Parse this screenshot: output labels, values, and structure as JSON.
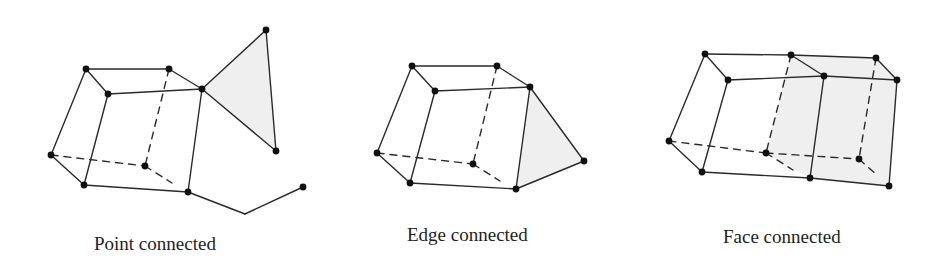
{
  "figure": {
    "background": "#ffffff",
    "line_color": "#2a2a2a",
    "fill_color": "#efefef",
    "dot_color": "#111111",
    "panels": [
      {
        "id": "point-connected",
        "caption": "Point connected",
        "caption_pos": [
          94,
          250
        ],
        "shaded": [
          [
            [
              202,
              89
            ],
            [
              266,
              30
            ],
            [
              276,
              151
            ]
          ]
        ],
        "solid_edges": [
          [
            [
              86,
              69
            ],
            [
              169,
              69
            ]
          ],
          [
            [
              86,
              69
            ],
            [
              108,
              94
            ]
          ],
          [
            [
              169,
              69
            ],
            [
              202,
              89
            ]
          ],
          [
            [
              108,
              94
            ],
            [
              202,
              89
            ]
          ],
          [
            [
              86,
              69
            ],
            [
              51,
              155
            ]
          ],
          [
            [
              108,
              94
            ],
            [
              84,
              185
            ]
          ],
          [
            [
              202,
              89
            ],
            [
              188,
              192
            ]
          ],
          [
            [
              51,
              155
            ],
            [
              84,
              185
            ]
          ],
          [
            [
              84,
              185
            ],
            [
              188,
              192
            ]
          ],
          [
            [
              202,
              89
            ],
            [
              266,
              30
            ]
          ],
          [
            [
              266,
              30
            ],
            [
              276,
              151
            ]
          ],
          [
            [
              202,
              89
            ],
            [
              276,
              151
            ]
          ],
          [
            [
              188,
              192
            ],
            [
              245,
              214
            ]
          ],
          [
            [
              245,
              214
            ],
            [
              303,
              187
            ]
          ]
        ],
        "dashed_edges": [
          [
            [
              169,
              69
            ],
            [
              145,
              166
            ]
          ],
          [
            [
              51,
              155
            ],
            [
              145,
              166
            ]
          ],
          [
            [
              145,
              166
            ],
            [
              172,
              183
            ]
          ]
        ],
        "dots": [
          [
            86,
            69
          ],
          [
            169,
            69
          ],
          [
            108,
            94
          ],
          [
            202,
            89
          ],
          [
            266,
            30
          ],
          [
            276,
            151
          ],
          [
            51,
            155
          ],
          [
            145,
            166
          ],
          [
            84,
            185
          ],
          [
            188,
            192
          ],
          [
            303,
            187
          ]
        ]
      },
      {
        "id": "edge-connected",
        "caption": "Edge connected",
        "caption_pos": [
          407,
          241
        ],
        "shaded": [
          [
            [
              530,
              87
            ],
            [
              584,
              161
            ],
            [
              516,
              189
            ]
          ]
        ],
        "solid_edges": [
          [
            [
              412,
              66
            ],
            [
              497,
              66
            ]
          ],
          [
            [
              412,
              66
            ],
            [
              435,
              91
            ]
          ],
          [
            [
              497,
              66
            ],
            [
              530,
              87
            ]
          ],
          [
            [
              435,
              91
            ],
            [
              530,
              87
            ]
          ],
          [
            [
              412,
              66
            ],
            [
              377,
              153
            ]
          ],
          [
            [
              435,
              91
            ],
            [
              410,
              183
            ]
          ],
          [
            [
              530,
              87
            ],
            [
              516,
              189
            ]
          ],
          [
            [
              377,
              153
            ],
            [
              410,
              183
            ]
          ],
          [
            [
              410,
              183
            ],
            [
              516,
              189
            ]
          ],
          [
            [
              530,
              87
            ],
            [
              584,
              161
            ]
          ],
          [
            [
              584,
              161
            ],
            [
              516,
              189
            ]
          ]
        ],
        "dashed_edges": [
          [
            [
              497,
              66
            ],
            [
              473,
              164
            ]
          ],
          [
            [
              377,
              153
            ],
            [
              473,
              164
            ]
          ],
          [
            [
              473,
              164
            ],
            [
              500,
              181
            ]
          ]
        ],
        "dots": [
          [
            412,
            66
          ],
          [
            497,
            66
          ],
          [
            435,
            91
          ],
          [
            530,
            87
          ],
          [
            377,
            153
          ],
          [
            473,
            164
          ],
          [
            410,
            183
          ],
          [
            516,
            189
          ],
          [
            584,
            161
          ]
        ]
      },
      {
        "id": "face-connected",
        "caption": "Face connected",
        "caption_pos": [
          723,
          243
        ],
        "shaded": [
          [
            [
              791,
              55
            ],
            [
              876,
              58
            ],
            [
              897,
              80
            ],
            [
              889,
              186
            ],
            [
              810,
              178
            ],
            [
              766,
              153
            ]
          ],
          [
            [
              791,
              55
            ],
            [
              824,
              76
            ],
            [
              810,
              178
            ],
            [
              766,
              153
            ]
          ]
        ],
        "solid_edges": [
          [
            [
              705,
              54
            ],
            [
              791,
              55
            ]
          ],
          [
            [
              791,
              55
            ],
            [
              876,
              58
            ]
          ],
          [
            [
              705,
              54
            ],
            [
              728,
              80
            ]
          ],
          [
            [
              791,
              55
            ],
            [
              824,
              76
            ]
          ],
          [
            [
              876,
              58
            ],
            [
              897,
              80
            ]
          ],
          [
            [
              728,
              80
            ],
            [
              824,
              76
            ]
          ],
          [
            [
              824,
              76
            ],
            [
              897,
              80
            ]
          ],
          [
            [
              705,
              54
            ],
            [
              669,
              141
            ]
          ],
          [
            [
              728,
              80
            ],
            [
              702,
              172
            ]
          ],
          [
            [
              824,
              76
            ],
            [
              810,
              178
            ]
          ],
          [
            [
              897,
              80
            ],
            [
              889,
              186
            ]
          ],
          [
            [
              669,
              141
            ],
            [
              702,
              172
            ]
          ],
          [
            [
              702,
              172
            ],
            [
              810,
              178
            ]
          ],
          [
            [
              810,
              178
            ],
            [
              889,
              186
            ]
          ]
        ],
        "dashed_edges": [
          [
            [
              791,
              55
            ],
            [
              766,
              153
            ]
          ],
          [
            [
              876,
              58
            ],
            [
              859,
              159
            ]
          ],
          [
            [
              669,
              141
            ],
            [
              766,
              153
            ]
          ],
          [
            [
              766,
              153
            ],
            [
              859,
              159
            ]
          ],
          [
            [
              766,
              153
            ],
            [
              793,
              170
            ]
          ],
          [
            [
              859,
              159
            ],
            [
              878,
              176
            ]
          ]
        ],
        "dots": [
          [
            705,
            54
          ],
          [
            791,
            55
          ],
          [
            876,
            58
          ],
          [
            728,
            80
          ],
          [
            824,
            76
          ],
          [
            897,
            80
          ],
          [
            669,
            141
          ],
          [
            766,
            153
          ],
          [
            859,
            159
          ],
          [
            702,
            172
          ],
          [
            810,
            178
          ],
          [
            889,
            186
          ]
        ]
      }
    ]
  }
}
